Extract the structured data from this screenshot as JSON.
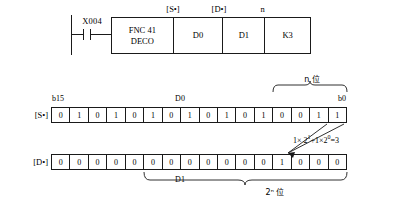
{
  "ladder": {
    "contact": {
      "label": "X004",
      "type": "normally-open"
    },
    "headers": {
      "s": "[S•]",
      "d": "[D•]",
      "n": "n"
    },
    "instruction": {
      "fnc_line1": "FNC 41",
      "fnc_line2": "DECO",
      "source": "D0",
      "destination": "D1",
      "count": "K3"
    }
  },
  "source_row": {
    "label": "[S•]",
    "msb_caption": "b15",
    "lsb_caption": "b0",
    "register": "D0",
    "bits": [
      "0",
      "1",
      "0",
      "1",
      "0",
      "1",
      "0",
      "1",
      "0",
      "1",
      "0",
      "1",
      "0",
      "0",
      "1",
      "1"
    ],
    "bracket_caption": "n 位"
  },
  "dest_row": {
    "label": "[D•]",
    "register": "D1",
    "bits": [
      "0",
      "0",
      "0",
      "0",
      "0",
      "0",
      "0",
      "0",
      "0",
      "0",
      "0",
      "0",
      "1",
      "0",
      "0",
      "0"
    ],
    "bracket_caption": "2ⁿ 位"
  },
  "annotation": {
    "formula_prefix": "1× 2",
    "formula_exp1": "1",
    "formula_mid": "+1×2",
    "formula_exp2": "0",
    "formula_suffix": "=3"
  },
  "colors": {
    "ink": "#1a1a1a",
    "background": "#ffffff"
  }
}
